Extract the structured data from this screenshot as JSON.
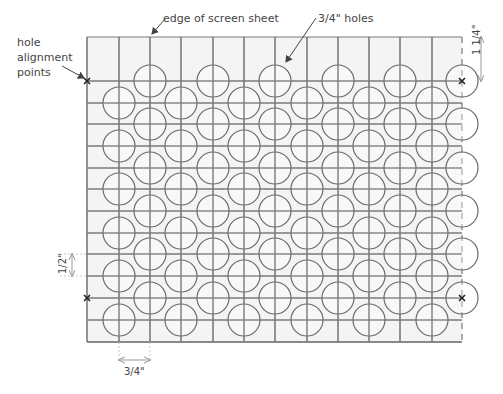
{
  "labels": {
    "edge": "edge of screen sheet",
    "holes": "3/4\" holes",
    "alignment_line1": "hole",
    "alignment_line2": "alignment",
    "alignment_line3": "points",
    "dim_right": "1 1/4\"",
    "dim_left": "1/2\"",
    "dim_bottom": "3/4\""
  },
  "sheet": {
    "left": 87,
    "top": 37,
    "right": 462,
    "bottom": 342
  },
  "grid": {
    "vlines": [
      87,
      119,
      150,
      181,
      213,
      244,
      275,
      307,
      338,
      369,
      400,
      432
    ],
    "hlines": [
      81,
      103,
      124,
      146,
      168,
      189,
      211,
      233,
      254,
      276,
      298,
      320,
      342
    ]
  },
  "holes": {
    "radius": 16,
    "even_cols": [
      150,
      213,
      275,
      338,
      400,
      462
    ],
    "even_rows": [
      81,
      124,
      168,
      211,
      254,
      298
    ],
    "odd_cols": [
      119,
      181,
      244,
      307,
      369,
      432
    ],
    "odd_rows": [
      103,
      146,
      189,
      233,
      276,
      320
    ]
  },
  "markers": [
    {
      "x": 87,
      "y": 81
    },
    {
      "x": 462,
      "y": 81
    },
    {
      "x": 87,
      "y": 298
    },
    {
      "x": 462,
      "y": 298
    }
  ],
  "colors": {
    "line": "#7a7a7a",
    "fill": "#f4f4f4",
    "circle": "#6a6a6a",
    "text": "#444444",
    "marker": "#222222"
  }
}
